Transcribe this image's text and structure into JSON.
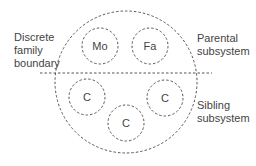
{
  "labels": {
    "boundary": [
      "Discrete",
      "family",
      "boundary"
    ],
    "parental": [
      "Parental",
      "subsystem"
    ],
    "sibling": [
      "Sibling",
      "subsystem"
    ]
  },
  "members": {
    "mother": "Mo",
    "father": "Fa",
    "child1": "C",
    "child2": "C",
    "child3": "C"
  },
  "colors": {
    "stroke": "#555555",
    "text": "#444444"
  }
}
